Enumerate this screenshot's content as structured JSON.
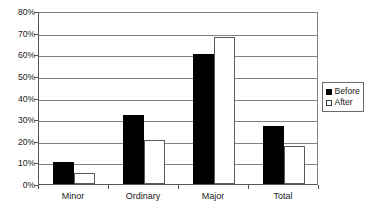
{
  "chart_data": {
    "type": "bar",
    "title": "",
    "subtitle": "",
    "xlabel": "",
    "ylabel": "",
    "categories": [
      "Minor",
      "Ordinary",
      "Major",
      "Total"
    ],
    "series": [
      {
        "name": "Before",
        "values": [
          10,
          32,
          60,
          27
        ],
        "color": "#000000",
        "fill": "solid-black"
      },
      {
        "name": "After",
        "values": [
          5,
          20.5,
          68,
          17.5
        ],
        "color": "#ffffff",
        "fill": "white-outlined"
      }
    ],
    "ylim": [
      0,
      80
    ],
    "ytick_step": 10,
    "ytick_labels": [
      "0%",
      "10%",
      "20%",
      "30%",
      "40%",
      "50%",
      "60%",
      "70%",
      "80%"
    ],
    "ytick_values": [
      0,
      10,
      20,
      30,
      40,
      50,
      60,
      70,
      80
    ],
    "value_suffix": "%",
    "grid": "horizontal",
    "legend_position": "right",
    "legend_entries": [
      "Before",
      "After"
    ],
    "annotations": []
  },
  "legend": {
    "items": [
      {
        "label": "Before",
        "swatch": "filled-square-icon"
      },
      {
        "label": "After",
        "swatch": "outlined-square-icon"
      }
    ]
  }
}
